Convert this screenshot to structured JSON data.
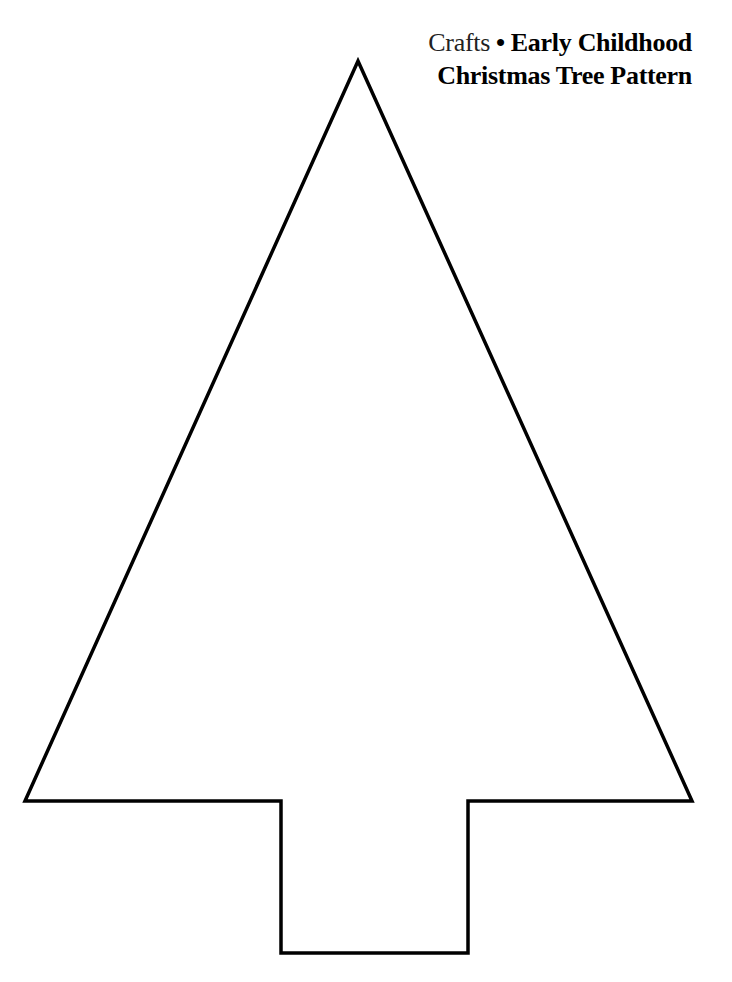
{
  "header": {
    "section": "Crafts",
    "separator": "•",
    "category": "Early Childhood",
    "title": "Christmas Tree Pattern"
  },
  "pattern": {
    "shape": "christmas-tree-outline",
    "stroke_color": "#000000",
    "fill_color": "#ffffff"
  }
}
